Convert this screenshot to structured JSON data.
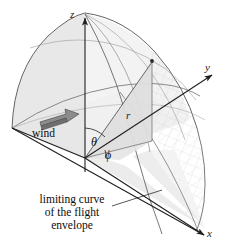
{
  "figure": {
    "title_fragment": "",
    "background_color": "#ffffff",
    "line_color": "#4a4a4a",
    "shade_light": "#ededed",
    "shade_mid": "#e2e2e2",
    "shade_dark": "#d4d4d4",
    "arrow_fill": "#8c8c8c",
    "arrow_stroke": "#5a5a5a",
    "text_color": "#0d0d0d"
  },
  "axes": {
    "z_label": "z",
    "y_label": "y",
    "x_label": "x"
  },
  "annotations": {
    "radius_label": "r",
    "polar_angle_label": "θ",
    "azimuth_angle_label": "ϕ",
    "wind_label": "wind"
  },
  "caption": {
    "line1": "limiting curve",
    "line2": "of the flight",
    "line3": "envelope"
  },
  "header": {
    "faint_text": ""
  }
}
